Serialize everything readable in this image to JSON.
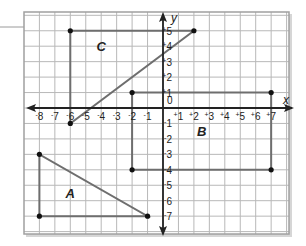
{
  "diagram": {
    "type": "coordinate-grid",
    "x_axis_label": "x",
    "y_axis_label": "y",
    "origin_label": "0",
    "grid": {
      "x_min": -9,
      "x_max": 8,
      "y_min": -8,
      "y_max": 6
    },
    "x_ticks": [
      {
        "value": -8,
        "label": "8",
        "sign": "-"
      },
      {
        "value": -7,
        "label": "7",
        "sign": "-"
      },
      {
        "value": -6,
        "label": "6",
        "sign": "-"
      },
      {
        "value": -5,
        "label": "5",
        "sign": "-"
      },
      {
        "value": -4,
        "label": "4",
        "sign": "-"
      },
      {
        "value": -3,
        "label": "3",
        "sign": "-"
      },
      {
        "value": -2,
        "label": "2",
        "sign": "-"
      },
      {
        "value": -1,
        "label": "1",
        "sign": "-"
      },
      {
        "value": 1,
        "label": "1",
        "sign": "+"
      },
      {
        "value": 2,
        "label": "2",
        "sign": "+"
      },
      {
        "value": 3,
        "label": "3",
        "sign": "+"
      },
      {
        "value": 4,
        "label": "4",
        "sign": "+"
      },
      {
        "value": 5,
        "label": "5",
        "sign": "+"
      },
      {
        "value": 6,
        "label": "6",
        "sign": "+"
      },
      {
        "value": 7,
        "label": "7",
        "sign": "+"
      }
    ],
    "y_ticks": [
      {
        "value": 5,
        "label": "5",
        "sign": "+"
      },
      {
        "value": 4,
        "label": "4",
        "sign": "+"
      },
      {
        "value": 3,
        "label": "3",
        "sign": "+"
      },
      {
        "value": 2,
        "label": "2",
        "sign": "+"
      },
      {
        "value": 1,
        "label": "1",
        "sign": "+"
      },
      {
        "value": -1,
        "label": "1",
        "sign": "-"
      },
      {
        "value": -2,
        "label": "2",
        "sign": "-"
      },
      {
        "value": -3,
        "label": "3",
        "sign": "-"
      },
      {
        "value": -4,
        "label": "4",
        "sign": "-"
      },
      {
        "value": -5,
        "label": "5",
        "sign": "-"
      },
      {
        "value": -6,
        "label": "6",
        "sign": "-"
      },
      {
        "value": -7,
        "label": "7",
        "sign": "-"
      }
    ],
    "shapes": [
      {
        "name": "C",
        "kind": "triangle",
        "vertices": [
          [
            -6,
            -1
          ],
          [
            -6,
            5
          ],
          [
            2,
            5
          ]
        ],
        "label_pos": [
          -4,
          4
        ]
      },
      {
        "name": "B",
        "kind": "rectangle",
        "vertices": [
          [
            -2,
            1
          ],
          [
            7,
            1
          ],
          [
            7,
            -4
          ],
          [
            -2,
            -4
          ]
        ],
        "label_pos": [
          2.5,
          -1.5
        ]
      },
      {
        "name": "A",
        "kind": "triangle",
        "vertices": [
          [
            -8,
            -3
          ],
          [
            -8,
            -7
          ],
          [
            -1,
            -7
          ]
        ],
        "label_pos": [
          -6,
          -5.5
        ]
      }
    ],
    "colors": {
      "grid": "#b8b8b8",
      "border": "#a0a0a0",
      "axes": "#222222",
      "shape_line": "#6e6e6e",
      "point": "#111111"
    }
  }
}
